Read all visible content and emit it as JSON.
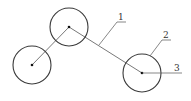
{
  "diagram": {
    "labels": {
      "l1": "1",
      "l2": "2",
      "l3": "3"
    },
    "colors": {
      "stroke": "#3a3a3a",
      "link": "#555555",
      "background": "#ffffff"
    },
    "nodes": [
      {
        "id": "left",
        "cx": 32,
        "cy": 65,
        "r": 19
      },
      {
        "id": "top",
        "cx": 69,
        "cy": 27,
        "r": 19
      },
      {
        "id": "right",
        "cx": 142,
        "cy": 73,
        "r": 19
      }
    ]
  }
}
